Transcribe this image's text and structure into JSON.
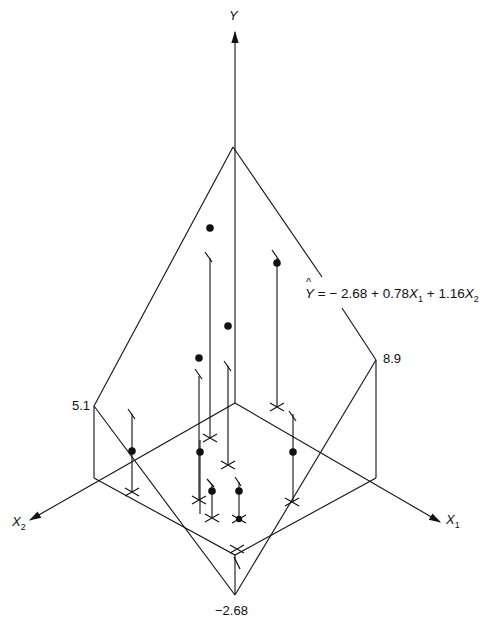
{
  "figure": {
    "type": "3d-regression-plane"
  },
  "axes": {
    "y": {
      "label": "Y"
    },
    "x1": {
      "label": "X",
      "subscript": "1"
    },
    "x2": {
      "label": "X",
      "subscript": "2"
    }
  },
  "plane_labels": {
    "intercept": "−2.68",
    "corner_x2": "5.1",
    "corner_x1": "8.9"
  },
  "equation": {
    "lhs": "Y",
    "hat": "^",
    "equals": " = − 2.68 + 0.78",
    "x1_var": "X",
    "x1_sub": "1",
    "plus": " + 1.16",
    "x2_var": "X",
    "x2_sub": "2",
    "intercept": -2.68,
    "b1": 0.78,
    "b2": 1.16
  },
  "observations": [
    {
      "id": 1,
      "dot": [
        210,
        228
      ],
      "proj_top": [
        205,
        254
      ],
      "base": [
        210,
        438
      ],
      "position": "above-plane"
    },
    {
      "id": 2,
      "dot": [
        277,
        263
      ],
      "proj_top": [
        273,
        254
      ],
      "base": [
        277,
        407
      ],
      "position": "above-plane"
    },
    {
      "id": 3,
      "dot": [
        228,
        326
      ],
      "proj_top": [
        228,
        363
      ],
      "base": [
        228,
        465
      ],
      "position": "above-plane"
    },
    {
      "id": 4,
      "dot": [
        199,
        358
      ],
      "proj_top": [
        197,
        372
      ],
      "base": [
        199,
        500
      ],
      "position": "above-plane"
    },
    {
      "id": 5,
      "dot": [
        132,
        451
      ],
      "proj_top": [
        130,
        410
      ],
      "base": [
        132,
        492
      ],
      "position": "below-plane"
    },
    {
      "id": 6,
      "dot": [
        293,
        452
      ],
      "proj_top": [
        292,
        411
      ],
      "base": [
        292,
        502
      ],
      "position": "below-plane"
    },
    {
      "id": 7,
      "dot": [
        212,
        491
      ],
      "proj_top": [
        209,
        480
      ],
      "base": [
        212,
        518
      ],
      "position": "below-plane"
    },
    {
      "id": 8,
      "dot": [
        239,
        491
      ],
      "proj_top": [
        237,
        478
      ],
      "base": [
        239,
        519
      ],
      "position": "below-plane"
    },
    {
      "id": 9,
      "dot": [
        200,
        452
      ],
      "proj_top": [
        198,
        380
      ],
      "base": [
        200,
        514
      ],
      "position": "below-plane"
    },
    {
      "id": 10,
      "dot": null,
      "proj_top": [
        237,
        560
      ],
      "base": [
        237,
        549
      ],
      "position": "near-intercept"
    }
  ],
  "colors": {
    "ink": "#111111",
    "background": "#ffffff"
  }
}
